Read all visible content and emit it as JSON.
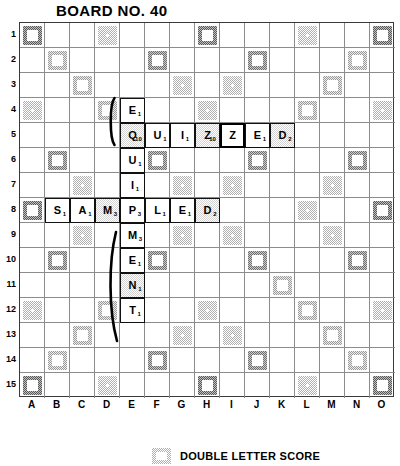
{
  "title": "BOARD NO. 40",
  "board": {
    "size": 15,
    "row_labels": [
      "1",
      "2",
      "3",
      "4",
      "5",
      "6",
      "7",
      "8",
      "9",
      "10",
      "11",
      "12",
      "13",
      "14",
      "15"
    ],
    "col_labels": [
      "A",
      "B",
      "C",
      "D",
      "E",
      "F",
      "G",
      "H",
      "I",
      "J",
      "K",
      "L",
      "M",
      "N",
      "O"
    ],
    "premium_legend_symbols": {
      "dl": "double-letter-score",
      "tl": "triple-letter-score",
      "dw": "double-word-score",
      "tw": "triple-word-score",
      "st": "center-star"
    },
    "premium_squares": [
      {
        "c": 0,
        "r": 0,
        "t": "tw"
      },
      {
        "c": 3,
        "r": 0,
        "t": "dl"
      },
      {
        "c": 7,
        "r": 0,
        "t": "tw"
      },
      {
        "c": 11,
        "r": 0,
        "t": "dl"
      },
      {
        "c": 14,
        "r": 0,
        "t": "tw"
      },
      {
        "c": 1,
        "r": 1,
        "t": "dw"
      },
      {
        "c": 5,
        "r": 1,
        "t": "tl"
      },
      {
        "c": 9,
        "r": 1,
        "t": "tl"
      },
      {
        "c": 13,
        "r": 1,
        "t": "dw"
      },
      {
        "c": 2,
        "r": 2,
        "t": "dw"
      },
      {
        "c": 6,
        "r": 2,
        "t": "dl"
      },
      {
        "c": 8,
        "r": 2,
        "t": "dl"
      },
      {
        "c": 12,
        "r": 2,
        "t": "dw"
      },
      {
        "c": 0,
        "r": 3,
        "t": "dl"
      },
      {
        "c": 3,
        "r": 3,
        "t": "dw"
      },
      {
        "c": 7,
        "r": 3,
        "t": "dl"
      },
      {
        "c": 11,
        "r": 3,
        "t": "dw"
      },
      {
        "c": 14,
        "r": 3,
        "t": "dl"
      },
      {
        "c": 4,
        "r": 4,
        "t": "dw"
      },
      {
        "c": 10,
        "r": 4,
        "t": "dw"
      },
      {
        "c": 1,
        "r": 5,
        "t": "tl"
      },
      {
        "c": 5,
        "r": 5,
        "t": "tl"
      },
      {
        "c": 9,
        "r": 5,
        "t": "tl"
      },
      {
        "c": 13,
        "r": 5,
        "t": "tl"
      },
      {
        "c": 2,
        "r": 6,
        "t": "dl"
      },
      {
        "c": 6,
        "r": 6,
        "t": "dl"
      },
      {
        "c": 8,
        "r": 6,
        "t": "dl"
      },
      {
        "c": 12,
        "r": 6,
        "t": "dl"
      },
      {
        "c": 0,
        "r": 7,
        "t": "tw"
      },
      {
        "c": 3,
        "r": 7,
        "t": "dl"
      },
      {
        "c": 7,
        "r": 7,
        "t": "st"
      },
      {
        "c": 11,
        "r": 7,
        "t": "dl"
      },
      {
        "c": 14,
        "r": 7,
        "t": "tw"
      },
      {
        "c": 2,
        "r": 8,
        "t": "dl"
      },
      {
        "c": 6,
        "r": 8,
        "t": "dl"
      },
      {
        "c": 8,
        "r": 8,
        "t": "dl"
      },
      {
        "c": 12,
        "r": 8,
        "t": "dl"
      },
      {
        "c": 1,
        "r": 9,
        "t": "tl"
      },
      {
        "c": 5,
        "r": 9,
        "t": "tl"
      },
      {
        "c": 9,
        "r": 9,
        "t": "tl"
      },
      {
        "c": 13,
        "r": 9,
        "t": "tl"
      },
      {
        "c": 4,
        "r": 10,
        "t": "dw"
      },
      {
        "c": 10,
        "r": 10,
        "t": "dw"
      },
      {
        "c": 0,
        "r": 11,
        "t": "dl"
      },
      {
        "c": 3,
        "r": 11,
        "t": "dw"
      },
      {
        "c": 7,
        "r": 11,
        "t": "dl"
      },
      {
        "c": 11,
        "r": 11,
        "t": "dw"
      },
      {
        "c": 14,
        "r": 11,
        "t": "dl"
      },
      {
        "c": 2,
        "r": 12,
        "t": "dw"
      },
      {
        "c": 6,
        "r": 12,
        "t": "dl"
      },
      {
        "c": 8,
        "r": 12,
        "t": "dl"
      },
      {
        "c": 12,
        "r": 12,
        "t": "dw"
      },
      {
        "c": 1,
        "r": 13,
        "t": "dw"
      },
      {
        "c": 5,
        "r": 13,
        "t": "tl"
      },
      {
        "c": 9,
        "r": 13,
        "t": "tl"
      },
      {
        "c": 13,
        "r": 13,
        "t": "dw"
      },
      {
        "c": 0,
        "r": 14,
        "t": "tw"
      },
      {
        "c": 3,
        "r": 14,
        "t": "dl"
      },
      {
        "c": 7,
        "r": 14,
        "t": "tw"
      },
      {
        "c": 11,
        "r": 14,
        "t": "dl"
      },
      {
        "c": 14,
        "r": 14,
        "t": "tw"
      }
    ],
    "tiles": [
      {
        "c": 4,
        "r": 3,
        "letter": "E",
        "value": "1",
        "on_premium": false,
        "blank": false
      },
      {
        "c": 4,
        "r": 4,
        "letter": "Q",
        "value": "10",
        "on_premium": true,
        "blank": false
      },
      {
        "c": 5,
        "r": 4,
        "letter": "U",
        "value": "1",
        "on_premium": false,
        "blank": false
      },
      {
        "c": 6,
        "r": 4,
        "letter": "I",
        "value": "1",
        "on_premium": false,
        "blank": false
      },
      {
        "c": 7,
        "r": 4,
        "letter": "Z",
        "value": "10",
        "on_premium": true,
        "blank": false
      },
      {
        "c": 8,
        "r": 4,
        "letter": "Z",
        "value": "",
        "on_premium": false,
        "blank": true
      },
      {
        "c": 9,
        "r": 4,
        "letter": "E",
        "value": "1",
        "on_premium": false,
        "blank": false
      },
      {
        "c": 10,
        "r": 4,
        "letter": "D",
        "value": "2",
        "on_premium": true,
        "blank": false
      },
      {
        "c": 4,
        "r": 5,
        "letter": "U",
        "value": "1",
        "on_premium": false,
        "blank": false
      },
      {
        "c": 4,
        "r": 6,
        "letter": "I",
        "value": "1",
        "on_premium": false,
        "blank": false
      },
      {
        "c": 1,
        "r": 7,
        "letter": "S",
        "value": "1",
        "on_premium": false,
        "blank": false
      },
      {
        "c": 2,
        "r": 7,
        "letter": "A",
        "value": "1",
        "on_premium": false,
        "blank": false
      },
      {
        "c": 3,
        "r": 7,
        "letter": "M",
        "value": "3",
        "on_premium": true,
        "blank": false
      },
      {
        "c": 4,
        "r": 7,
        "letter": "P",
        "value": "3",
        "on_premium": false,
        "blank": false
      },
      {
        "c": 5,
        "r": 7,
        "letter": "L",
        "value": "1",
        "on_premium": false,
        "blank": false
      },
      {
        "c": 6,
        "r": 7,
        "letter": "E",
        "value": "1",
        "on_premium": false,
        "blank": false
      },
      {
        "c": 7,
        "r": 7,
        "letter": "D",
        "value": "2",
        "on_premium": true,
        "blank": false
      },
      {
        "c": 4,
        "r": 8,
        "letter": "M",
        "value": "3",
        "on_premium": false,
        "blank": false
      },
      {
        "c": 4,
        "r": 9,
        "letter": "E",
        "value": "1",
        "on_premium": false,
        "blank": false
      },
      {
        "c": 4,
        "r": 10,
        "letter": "N",
        "value": "1",
        "on_premium": true,
        "blank": false
      },
      {
        "c": 4,
        "r": 11,
        "letter": "T",
        "value": "1",
        "on_premium": false,
        "blank": false
      }
    ],
    "annotations": [
      {
        "name": "brace-upper",
        "shape": "curved-brace",
        "spans_rows": "4"
      },
      {
        "name": "brace-lower",
        "shape": "curved-brace",
        "spans_rows": "9-12"
      }
    ]
  },
  "legend": {
    "swatch": "double-letter-swatch",
    "label": "DOUBLE LETTER SCORE"
  }
}
